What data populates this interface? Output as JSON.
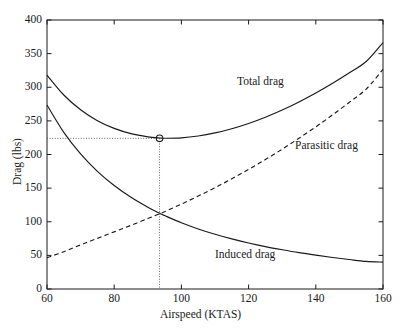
{
  "chart_data": {
    "type": "line",
    "title": "",
    "xlabel": "Airspeed (KTAS)",
    "ylabel": "Drag (lbs)",
    "xlim": [
      60,
      160
    ],
    "ylim": [
      0,
      400
    ],
    "xticks": [
      60,
      80,
      100,
      120,
      140,
      160
    ],
    "yticks": [
      0,
      50,
      100,
      150,
      200,
      250,
      300,
      350,
      400
    ],
    "grid": false,
    "legend_position": "inline-annotations",
    "x": [
      60,
      65,
      70,
      75,
      80,
      85,
      90,
      93.5,
      95,
      100,
      105,
      110,
      115,
      120,
      125,
      130,
      135,
      140,
      145,
      150,
      155,
      160
    ],
    "series": [
      {
        "name": "Total drag",
        "style": "solid",
        "color": "#1a1a1a",
        "values": [
          318.0,
          288.5,
          266.5,
          250.3,
          238.8,
          231.0,
          226.3,
          224.5,
          224.2,
          224.8,
          227.5,
          232.1,
          238.4,
          246.2,
          255.5,
          266.2,
          278.2,
          291.4,
          305.9,
          321.5,
          338.3,
          366.5
        ]
      },
      {
        "name": "Induced drag",
        "style": "solid",
        "color": "#1a1a1a",
        "values": [
          273.5,
          233.0,
          200.9,
          175.0,
          153.8,
          136.3,
          121.6,
          112.7,
          109.2,
          98.5,
          89.3,
          81.4,
          74.5,
          68.4,
          63.0,
          58.3,
          54.0,
          50.3,
          46.9,
          43.8,
          41.0,
          40.0
        ]
      },
      {
        "name": "Parasitic drag",
        "style": "dashed",
        "color": "#1a1a1a",
        "values": [
          46.5,
          55.5,
          65.6,
          75.3,
          85.0,
          94.7,
          104.7,
          111.8,
          115.0,
          126.3,
          138.2,
          150.7,
          163.9,
          177.8,
          192.5,
          207.9,
          224.2,
          241.1,
          259.0,
          277.7,
          297.3,
          326.5
        ]
      }
    ],
    "annotations": [
      {
        "name": "total-drag-label",
        "text": "Total drag",
        "x": 117,
        "y": 296
      },
      {
        "name": "parasitic-drag-label",
        "text": "Parasitic drag",
        "x": 133,
        "y": 209
      },
      {
        "name": "induced-drag-label",
        "text": "Induced drag",
        "x": 110,
        "y": 55
      }
    ],
    "markers": [
      {
        "name": "minimum-drag-point",
        "shape": "circle",
        "x": 93.5,
        "y": 224,
        "guide_lines": {
          "horizontal_to_y_axis": true,
          "vertical_to_x_axis": true,
          "style": "dotted"
        }
      }
    ]
  }
}
